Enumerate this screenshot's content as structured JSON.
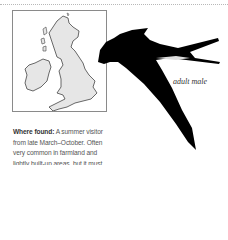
{
  "divider": {
    "style": "dotted"
  },
  "map": {
    "region": "British Isles",
    "fill": "#e6e6e6",
    "stroke": "#444444"
  },
  "bird": {
    "species_silhouette": "swallow",
    "color": "#000000",
    "caption": "adult male"
  },
  "description": {
    "label": "Where found:",
    "lines": [
      "A summer visitor",
      "from late March–October. Often",
      "very common in farmland and",
      "lightly built-up areas, but it must"
    ]
  }
}
